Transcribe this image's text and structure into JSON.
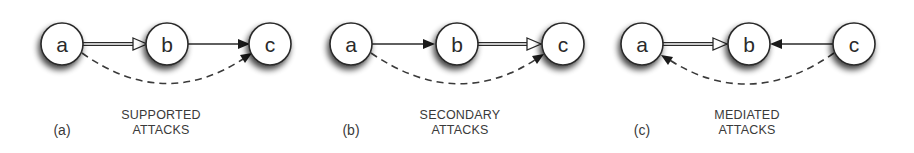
{
  "diagram": {
    "background": "#ffffff",
    "node_fill": "#ffffff",
    "node_stroke": "#2a2a2a",
    "edge_color": "#2a2a2a",
    "edge_legend": {
      "double_hollow_arrow": "support",
      "solid_arrow": "attack",
      "dashed_arrow": "inferred attack"
    },
    "panels": [
      {
        "id": "(a)",
        "caption_line1": "SUPPORTED",
        "caption_line2": "ATTACKS",
        "nodes": [
          {
            "label": "a",
            "x": 62,
            "y": 44
          },
          {
            "label": "b",
            "x": 167,
            "y": 44
          },
          {
            "label": "c",
            "x": 270,
            "y": 44
          }
        ],
        "edges": [
          {
            "from": "a",
            "to": "b",
            "type": "support"
          },
          {
            "from": "b",
            "to": "c",
            "type": "attack"
          },
          {
            "from": "a",
            "to": "c",
            "type": "inferred-attack"
          }
        ]
      },
      {
        "id": "(b)",
        "caption_line1": "SECONDARY",
        "caption_line2": "ATTACKS",
        "nodes": [
          {
            "label": "a",
            "x": 351,
            "y": 44
          },
          {
            "label": "b",
            "x": 457,
            "y": 44
          },
          {
            "label": "c",
            "x": 563,
            "y": 44
          }
        ],
        "edges": [
          {
            "from": "a",
            "to": "b",
            "type": "attack"
          },
          {
            "from": "b",
            "to": "c",
            "type": "support"
          },
          {
            "from": "a",
            "to": "c",
            "type": "inferred-attack"
          }
        ]
      },
      {
        "id": "(c)",
        "caption_line1": "MEDIATED",
        "caption_line2": "ATTACKS",
        "nodes": [
          {
            "label": "a",
            "x": 642,
            "y": 44
          },
          {
            "label": "b",
            "x": 749,
            "y": 44
          },
          {
            "label": "c",
            "x": 854,
            "y": 44
          }
        ],
        "edges": [
          {
            "from": "a",
            "to": "b",
            "type": "support"
          },
          {
            "from": "c",
            "to": "b",
            "type": "attack"
          },
          {
            "from": "c",
            "to": "a",
            "type": "inferred-attack"
          }
        ]
      }
    ]
  }
}
